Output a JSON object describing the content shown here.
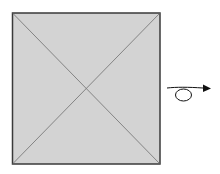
{
  "diagram": {
    "square": {
      "x": 12.5,
      "y": 13,
      "width": 147.5,
      "height": 151,
      "fill": "#d3d3d3",
      "stroke": "#3a3a3a",
      "diagonal_color": "#7a7a7a"
    },
    "rotation_arrow": {
      "color": "#111111",
      "direction": "right",
      "icon": "loop-arrow-icon"
    }
  }
}
